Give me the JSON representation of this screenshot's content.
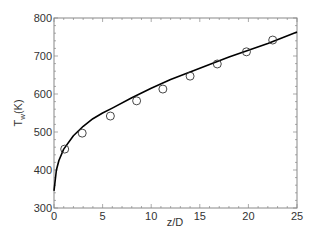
{
  "chart_data": {
    "type": "line",
    "title": "",
    "xlabel": "z/D",
    "ylabel": "T_w(K)",
    "xlim": [
      0,
      25
    ],
    "ylim": [
      300,
      800
    ],
    "x_ticks": [
      0,
      5,
      10,
      15,
      20,
      25
    ],
    "y_ticks": [
      300,
      400,
      500,
      600,
      700,
      800
    ],
    "grid": false,
    "legend": null,
    "series": [
      {
        "name": "prediction",
        "style": "solid-line",
        "color": "#000000",
        "x": [
          0,
          0.25,
          0.5,
          1,
          2,
          3,
          4,
          5,
          6,
          8,
          10,
          12,
          14,
          16,
          18,
          20,
          22,
          25
        ],
        "y": [
          345,
          400,
          425,
          455,
          490,
          515,
          535,
          550,
          563,
          590,
          615,
          638,
          658,
          678,
          697,
          715,
          733,
          763
        ]
      },
      {
        "name": "measurement",
        "style": "open-circle",
        "color": "#000000",
        "x": [
          1.1,
          2.9,
          5.8,
          8.5,
          11.2,
          14.0,
          16.8,
          19.8,
          22.5
        ],
        "y": [
          455,
          497,
          542,
          582,
          613,
          647,
          679,
          711,
          742
        ]
      }
    ]
  },
  "axis": {
    "x_label": "z/D",
    "y_label_main": "T",
    "y_label_sub": "w",
    "y_label_unit": "(K)"
  }
}
